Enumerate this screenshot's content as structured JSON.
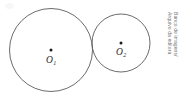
{
  "figure": {
    "background_color": "#ffffff",
    "stroke_color": "#5a5a5a",
    "dot_color": "#1b1b1b",
    "label_color": "#2a2a2a",
    "credit_color": "#777777"
  },
  "shapes": {
    "large_circle": {
      "name": "large-circle",
      "cx": 51,
      "cy": 50,
      "r": 41.5,
      "center_label": "O",
      "center_subscript": "1"
    },
    "small_circle": {
      "name": "small-circle",
      "cx": 121,
      "cy": 43,
      "r": 29,
      "center_label": "O",
      "center_subscript": "2"
    }
  },
  "credit": {
    "line1": "Banco de imagens/",
    "line2": "Arquivo da editora"
  }
}
